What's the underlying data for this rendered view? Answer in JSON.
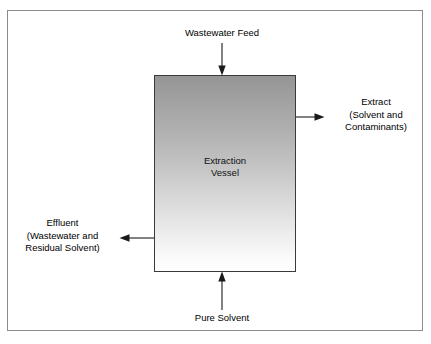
{
  "diagram": {
    "frame": {
      "border_color": "#8c8c8c"
    },
    "vessel": {
      "name": "Extraction Vessel",
      "label": "Extraction\nVessel",
      "border_color": "#3a3a3a",
      "fill_top_color": "#959595",
      "fill_bottom_color": "#ffffff"
    },
    "streams": [
      {
        "id": "wastewater-feed",
        "label": "Wastewater Feed",
        "direction": "down",
        "position": "top",
        "role": "inlet"
      },
      {
        "id": "extract",
        "label": "Extract\n(Solvent and\nContaminants)",
        "direction": "right",
        "position": "right",
        "role": "outlet"
      },
      {
        "id": "effluent",
        "label": "Effluent\n(Wastewater and\nResidual Solvent)",
        "direction": "left",
        "position": "left",
        "role": "outlet"
      },
      {
        "id": "pure-solvent",
        "label": "Pure Solvent",
        "direction": "up",
        "position": "bottom",
        "role": "inlet"
      }
    ],
    "arrow_color": "#1a1a1a"
  }
}
